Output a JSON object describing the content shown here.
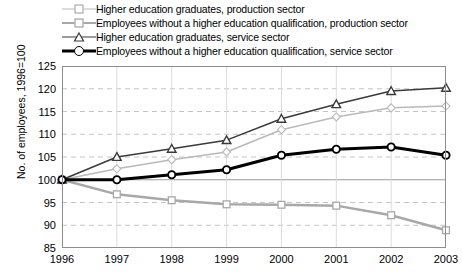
{
  "chart_data": {
    "type": "line",
    "title": "",
    "xlabel": "",
    "ylabel": "No. of employees, 1996=100",
    "categories": [
      "1996",
      "1997",
      "1998",
      "1999",
      "2000",
      "2001",
      "2002",
      "2003"
    ],
    "ylim": [
      85,
      125
    ],
    "yticks": [
      85,
      90,
      95,
      100,
      105,
      110,
      115,
      120,
      125
    ],
    "grid": true,
    "legend_position": "top",
    "series": [
      {
        "name": "Higher education graduates, production sector",
        "marker": "diamond",
        "color": "#b9b9b9",
        "values": [
          100,
          102.4,
          104.4,
          106.1,
          111.0,
          113.8,
          115.8,
          116.2
        ]
      },
      {
        "name": "Employees without a higher education qualification, production sector",
        "marker": "square",
        "color": "#a8a8a8",
        "values": [
          100,
          96.8,
          95.5,
          94.6,
          94.5,
          94.3,
          92.2,
          88.9
        ]
      },
      {
        "name": "Higher education graduates, service sector",
        "marker": "triangle",
        "color": "#3a3a3a",
        "values": [
          100,
          105.0,
          106.8,
          108.7,
          113.4,
          116.6,
          119.5,
          120.2
        ]
      },
      {
        "name": "Employees without a higher education qualification, service sector",
        "marker": "circle",
        "color": "#000000",
        "values": [
          100,
          100.0,
          101.1,
          102.2,
          105.4,
          106.7,
          107.2,
          105.4
        ]
      }
    ]
  }
}
